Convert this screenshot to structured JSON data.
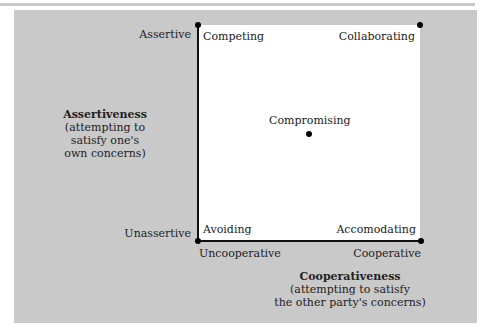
{
  "diagram": {
    "y_axis": {
      "top_label": "Assertive",
      "bottom_label": "Unassertive",
      "title": "Assertiveness",
      "subtitle_lines": [
        "(attempting to",
        "satisfy one's",
        "own concerns)"
      ]
    },
    "x_axis": {
      "left_label": "Uncooperative",
      "right_label": "Cooperative",
      "title": "Cooperativeness",
      "subtitle_lines": [
        "(attempting to satisfy",
        "the other party's concerns)"
      ]
    },
    "modes": {
      "top_left": "Competing",
      "top_right": "Collaborating",
      "center": "Compromising",
      "bottom_left": "Avoiding",
      "bottom_right": "Accomodating"
    },
    "colors": {
      "panel": "#c9c9c9",
      "square": "#ffffff",
      "axis": "#111111"
    }
  }
}
